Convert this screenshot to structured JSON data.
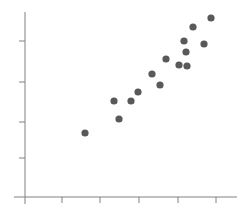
{
  "chart_data": {
    "type": "scatter",
    "title": "",
    "subtitle": "",
    "xlabel": "",
    "ylabel": "",
    "grid": false,
    "legend": null,
    "legend_position": "none",
    "marker": {
      "shape": "circle",
      "color": "#595959",
      "radius_px": 3.6,
      "opacity": 1
    },
    "axes": {
      "color": "#808080",
      "line_width_px": 1,
      "x_axis_y_px": 197,
      "y_axis_x_px": 25,
      "x_axis_start_px": 14,
      "x_axis_end_px": 237,
      "y_axis_start_px": 12,
      "y_axis_end_px": 204,
      "tick_length_px": 6,
      "x_tick_positions_px": [
        62,
        100,
        139,
        178,
        216
      ],
      "y_tick_positions_px": [
        41,
        82,
        122,
        158
      ],
      "x_tick_labels": [],
      "y_tick_labels": [],
      "xlim_px": [
        25,
        237
      ],
      "ylim_px": [
        12,
        197
      ]
    },
    "points_px": [
      {
        "x": 85,
        "y": 133
      },
      {
        "x": 114,
        "y": 101
      },
      {
        "x": 119,
        "y": 119
      },
      {
        "x": 131,
        "y": 101
      },
      {
        "x": 138,
        "y": 92
      },
      {
        "x": 152,
        "y": 74
      },
      {
        "x": 160,
        "y": 85
      },
      {
        "x": 166,
        "y": 59
      },
      {
        "x": 179,
        "y": 65
      },
      {
        "x": 184,
        "y": 41
      },
      {
        "x": 186,
        "y": 52
      },
      {
        "x": 187,
        "y": 66
      },
      {
        "x": 193,
        "y": 27
      },
      {
        "x": 204,
        "y": 44
      },
      {
        "x": 211,
        "y": 18
      }
    ],
    "x": [
      85,
      114,
      119,
      131,
      138,
      152,
      160,
      166,
      179,
      184,
      186,
      187,
      193,
      204,
      211
    ],
    "y": [
      133,
      101,
      119,
      101,
      92,
      74,
      85,
      59,
      65,
      41,
      52,
      66,
      27,
      44,
      18
    ],
    "n_points": 15
  }
}
